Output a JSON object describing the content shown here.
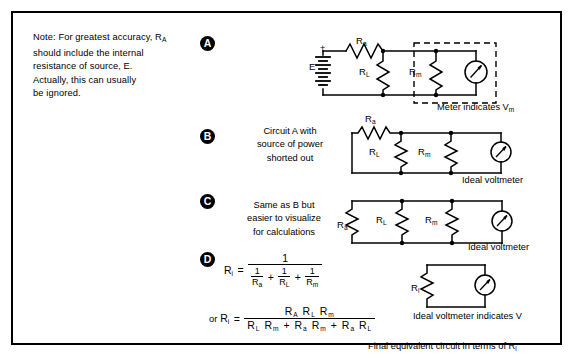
{
  "figure": {
    "note": "Note: For greatest accuracy, Rₐ should include the internal resistance of source, E. Actually, this can usually be ignored.",
    "note_lines": [
      "Note: For greatest accuracy, R",
      "should include the internal",
      "resistance of source, E.",
      "Actually, this can usually",
      "be ignored."
    ],
    "note_first_line_sub": "A"
  },
  "sections": {
    "a": {
      "bullet": "A",
      "caption_below": "Meter indicates V",
      "caption_below_sub": "m",
      "labels": {
        "source": "E",
        "plus": "+",
        "minus": "–",
        "r_series": "R",
        "r_series_sub": "a",
        "r_load": "R",
        "r_load_sub": "L",
        "r_meter": "R",
        "r_meter_sub": "m"
      }
    },
    "b": {
      "bullet": "B",
      "caption_lines": [
        "Circuit A with",
        "source of power",
        "shorted out"
      ],
      "caption_below": "Ideal voltmeter",
      "labels": {
        "r_series": "R",
        "r_series_sub": "a",
        "r_load": "R",
        "r_load_sub": "L",
        "r_meter": "R",
        "r_meter_sub": "m"
      }
    },
    "c": {
      "bullet": "C",
      "caption_lines": [
        "Same as B but",
        "easier to visualize",
        "for calculations"
      ],
      "caption_below": "Ideal voltmeter",
      "labels": {
        "r_series": "R",
        "r_series_sub": "a",
        "r_load": "R",
        "r_load_sub": "L",
        "r_meter": "R",
        "r_meter_sub": "m"
      }
    },
    "d": {
      "bullet": "D",
      "equation1": {
        "lhs": "R",
        "lhs_sub": "i",
        "equals": "=",
        "numerator": "1",
        "den_terms": [
          {
            "num": "1",
            "den": "R",
            "den_sub": "a"
          },
          {
            "num": "1",
            "den": "R",
            "den_sub": "L"
          },
          {
            "num": "1",
            "den": "R",
            "den_sub": "m"
          }
        ],
        "den_ops": [
          "+",
          "+"
        ]
      },
      "equation2": {
        "prefix": "or",
        "lhs": "R",
        "lhs_sub": "i",
        "equals": "=",
        "numerator": "Rᴀ Rʟ Rₘ",
        "numerator_parts": [
          {
            "base": "R",
            "sub": "A"
          },
          {
            "base": "R",
            "sub": "L"
          },
          {
            "base": "R",
            "sub": "m"
          }
        ],
        "denominator_parts": [
          {
            "base": "R",
            "sub": "L"
          },
          {
            "base": "R",
            "sub": "m"
          },
          {
            "op": "+"
          },
          {
            "base": "R",
            "sub": "a"
          },
          {
            "base": "R",
            "sub": "m"
          },
          {
            "op": "+"
          },
          {
            "base": "R",
            "sub": "a"
          },
          {
            "base": "R",
            "sub": "L"
          }
        ]
      },
      "circuit_label": "R",
      "circuit_label_sub": "i",
      "caption_below": "Ideal voltmeter indicates V",
      "caption_final": "Final equivalent circuit in terms of R",
      "caption_final_sub": "i"
    }
  },
  "colors": {
    "ink": "#000000",
    "paper": "#ffffff"
  },
  "icons": {
    "meter": "analog-meter-icon",
    "battery": "battery-icon",
    "resistor": "resistor-icon"
  }
}
